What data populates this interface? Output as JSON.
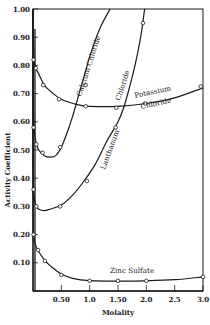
{
  "chart_data": {
    "type": "line",
    "title": "",
    "xlabel": "Molality",
    "ylabel": "Activity Coefficient",
    "xlim": [
      0,
      3.0
    ],
    "ylim": [
      0,
      1.0
    ],
    "grid": false,
    "legend": "inline curve labels",
    "x_ticks": [
      {
        "value": 0.5,
        "label": "0.50"
      },
      {
        "value": 1.0,
        "label": "1.0"
      },
      {
        "value": 1.5,
        "label": "1.50"
      },
      {
        "value": 2.0,
        "label": "2.0"
      },
      {
        "value": 2.5,
        "label": "2.5"
      },
      {
        "value": 3.0,
        "label": "3.0"
      }
    ],
    "y_ticks": [
      {
        "value": 0.1,
        "label": "0.10"
      },
      {
        "value": 0.2,
        "label": "0.20"
      },
      {
        "value": 0.3,
        "label": "0.30"
      },
      {
        "value": 0.4,
        "label": "0.40"
      },
      {
        "value": 0.5,
        "label": "0.50"
      },
      {
        "value": 0.6,
        "label": "0.60"
      },
      {
        "value": 0.7,
        "label": "0.70"
      },
      {
        "value": 0.8,
        "label": "0.80"
      },
      {
        "value": 0.9,
        "label": "0.90"
      },
      {
        "value": 1.0,
        "label": "1.00"
      }
    ],
    "series": [
      {
        "name": "Potassium Chloride",
        "label_lines": [
          "Potassium",
          "Chloride"
        ],
        "curve": [
          [
            0.0,
            1.0
          ],
          [
            0.005,
            0.93
          ],
          [
            0.02,
            0.82
          ],
          [
            0.05,
            0.79
          ],
          [
            0.1,
            0.77
          ],
          [
            0.2,
            0.73
          ],
          [
            0.3,
            0.71
          ],
          [
            0.5,
            0.68
          ],
          [
            0.8,
            0.66
          ],
          [
            1.0,
            0.655
          ],
          [
            1.5,
            0.655
          ],
          [
            2.0,
            0.665
          ],
          [
            2.5,
            0.685
          ],
          [
            3.0,
            0.72
          ]
        ],
        "points": [
          [
            0.01,
            0.82
          ],
          [
            0.05,
            0.79
          ],
          [
            0.18,
            0.73
          ],
          [
            0.46,
            0.68
          ],
          [
            0.93,
            0.655
          ],
          [
            1.47,
            0.65
          ],
          [
            1.98,
            0.665
          ],
          [
            2.96,
            0.725
          ]
        ]
      },
      {
        "name": "Calcium Chloride",
        "label_lines": [
          "Calcium Chloride"
        ],
        "curve": [
          [
            0.0,
            1.0
          ],
          [
            0.003,
            0.85
          ],
          [
            0.01,
            0.66
          ],
          [
            0.02,
            0.58
          ],
          [
            0.05,
            0.53
          ],
          [
            0.1,
            0.5
          ],
          [
            0.2,
            0.48
          ],
          [
            0.3,
            0.475
          ],
          [
            0.4,
            0.48
          ],
          [
            0.5,
            0.51
          ],
          [
            0.6,
            0.56
          ],
          [
            0.7,
            0.62
          ],
          [
            0.8,
            0.69
          ],
          [
            0.9,
            0.76
          ],
          [
            1.0,
            0.83
          ],
          [
            1.1,
            0.89
          ],
          [
            1.2,
            0.94
          ],
          [
            1.36,
            1.0
          ]
        ],
        "points": [
          [
            0.01,
            0.58
          ],
          [
            0.06,
            0.52
          ],
          [
            0.17,
            0.49
          ],
          [
            0.48,
            0.51
          ],
          [
            0.93,
            0.73
          ]
        ]
      },
      {
        "name": "Lanthanum Chloride",
        "label_lines": [
          "Lanthanum",
          "Chloride"
        ],
        "curve": [
          [
            0.0,
            1.0
          ],
          [
            0.002,
            0.7
          ],
          [
            0.005,
            0.45
          ],
          [
            0.01,
            0.36
          ],
          [
            0.03,
            0.32
          ],
          [
            0.06,
            0.3
          ],
          [
            0.1,
            0.29
          ],
          [
            0.2,
            0.285
          ],
          [
            0.3,
            0.29
          ],
          [
            0.5,
            0.305
          ],
          [
            0.7,
            0.34
          ],
          [
            0.9,
            0.39
          ],
          [
            1.1,
            0.45
          ],
          [
            1.3,
            0.53
          ],
          [
            1.5,
            0.6
          ],
          [
            1.6,
            0.65
          ],
          [
            1.7,
            0.72
          ],
          [
            1.8,
            0.8
          ],
          [
            1.9,
            0.9
          ],
          [
            1.97,
            1.0
          ]
        ],
        "points": [
          [
            0.01,
            0.36
          ],
          [
            0.06,
            0.3
          ],
          [
            0.48,
            0.3
          ],
          [
            0.95,
            0.39
          ],
          [
            1.46,
            0.58
          ],
          [
            1.94,
            0.95
          ]
        ]
      },
      {
        "name": "Zinc Sulfate",
        "label_lines": [
          "Zinc Sulfate"
        ],
        "curve": [
          [
            0.0,
            0.8
          ],
          [
            0.002,
            0.5
          ],
          [
            0.005,
            0.3
          ],
          [
            0.01,
            0.2
          ],
          [
            0.05,
            0.16
          ],
          [
            0.1,
            0.14
          ],
          [
            0.2,
            0.11
          ],
          [
            0.3,
            0.09
          ],
          [
            0.5,
            0.06
          ],
          [
            0.7,
            0.045
          ],
          [
            1.0,
            0.037
          ],
          [
            1.5,
            0.035
          ],
          [
            2.0,
            0.036
          ],
          [
            2.5,
            0.04
          ],
          [
            3.0,
            0.05
          ]
        ],
        "points": [
          [
            0.01,
            0.2
          ],
          [
            0.09,
            0.145
          ],
          [
            0.21,
            0.107
          ],
          [
            0.5,
            0.057
          ],
          [
            1.0,
            0.036
          ],
          [
            1.5,
            0.036
          ],
          [
            2.0,
            0.036
          ],
          [
            3.0,
            0.05
          ]
        ]
      }
    ]
  }
}
